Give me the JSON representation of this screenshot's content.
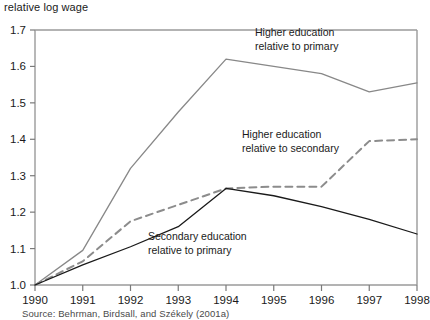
{
  "figure": {
    "y_axis_title": "relative log wage",
    "source_note": "Source: Behrman, Birdsall, and Székely (2001a)"
  },
  "chart_data": {
    "type": "line",
    "title": "",
    "xlabel": "",
    "ylabel": "relative log wage",
    "x": [
      1990,
      1991,
      1992,
      1993,
      1994,
      1995,
      1996,
      1997,
      1998
    ],
    "xtick_labels": [
      "1990",
      "1991",
      "1992",
      "1993",
      "1994",
      "1995",
      "1996",
      "1997",
      "1998"
    ],
    "ytick_labels": [
      "1.0",
      "1.1",
      "1.2",
      "1.3",
      "1.4",
      "1.5",
      "1.6",
      "1.7"
    ],
    "yticks": [
      1.0,
      1.1,
      1.2,
      1.3,
      1.4,
      1.5,
      1.6,
      1.7
    ],
    "xlim": [
      1990,
      1998
    ],
    "ylim": [
      1.0,
      1.7
    ],
    "grid": false,
    "legend_position": "inline-annotations",
    "series": [
      {
        "name": "Higher education relative to primary",
        "label_line1": "Higher education",
        "label_line2": "relative to primary",
        "color": "#888888",
        "style": "solid",
        "values": [
          1.0,
          1.095,
          1.32,
          1.475,
          1.62,
          1.6,
          1.58,
          1.53,
          1.555
        ]
      },
      {
        "name": "Higher education relative to secondary",
        "label_line1": "Higher education",
        "label_line2": "relative to secondary",
        "color": "#8c8c8c",
        "style": "dashed",
        "values": [
          1.0,
          1.065,
          1.175,
          1.22,
          1.265,
          1.27,
          1.27,
          1.395,
          1.4
        ]
      },
      {
        "name": "Secondary education relative to primary",
        "label_line1": "Secondary education",
        "label_line2": "relative to primary",
        "color": "#1a1a1a",
        "style": "solid",
        "values": [
          1.0,
          1.055,
          1.105,
          1.16,
          1.265,
          1.245,
          1.215,
          1.18,
          1.14
        ]
      }
    ],
    "annotations": [
      {
        "text_line1": "Higher education",
        "text_line2": "relative to primary",
        "x_px": 255,
        "y_px": 36
      },
      {
        "text_line1": "Higher education",
        "text_line2": "relative to secondary",
        "x_px": 242,
        "y_px": 138
      },
      {
        "text_line1": "Secondary education",
        "text_line2": "relative to primary",
        "x_px": 148,
        "y_px": 240
      }
    ]
  }
}
